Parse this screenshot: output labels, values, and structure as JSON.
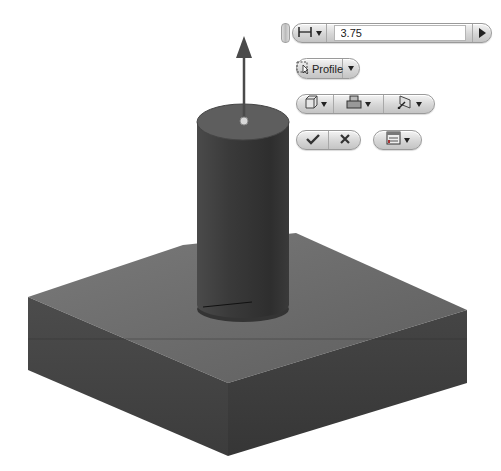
{
  "scene": {
    "description": "Extrude preview: cylinder on square base block",
    "colors": {
      "background": "#ffffff",
      "body_dark": "#3a3a3a",
      "body_mid": "#5c5c5c",
      "top_face": "#6e6e6e"
    }
  },
  "mini_toolbar": {
    "distance_icon": "dimension-distance-icon",
    "distance_value": "3.75",
    "apply_arrow_icon": "play-arrow-icon",
    "profile_label": "Profile",
    "profile_icon": "select-profile-icon",
    "output_icon": "solid-output-icon",
    "operation_icon": "join-operation-icon",
    "direction_icon": "direction-icon",
    "ok_icon": "checkmark-icon",
    "cancel_icon": "x-icon",
    "options_icon": "options-list-icon"
  }
}
